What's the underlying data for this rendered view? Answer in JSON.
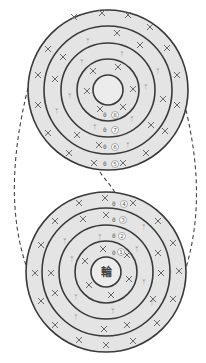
{
  "diagram": {
    "type": "crochet-chart",
    "colors": {
      "fill": "#e4e4e4",
      "line": "#3a3a3a",
      "symbol": "#6a6a6a"
    },
    "top_chart": {
      "rounds": [
        "8",
        "7",
        "6",
        "5"
      ],
      "center_label": ""
    },
    "bottom_chart": {
      "rounds": [
        "1",
        "2",
        "3",
        "4"
      ],
      "center_label": "輪"
    },
    "symbols": {
      "single_crochet": "×",
      "increase": "⋎",
      "chain_start": "0"
    }
  }
}
